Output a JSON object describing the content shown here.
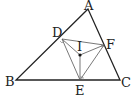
{
  "diagram": {
    "type": "geometry",
    "labels": {
      "A": "A",
      "B": "B",
      "C": "C",
      "D": "D",
      "E": "E",
      "F": "F",
      "I": "I"
    },
    "points": {
      "A": [
        88,
        9
      ],
      "B": [
        16,
        80
      ],
      "C": [
        120,
        80
      ],
      "D": [
        62,
        39
      ],
      "E": [
        80,
        80
      ],
      "F": [
        104,
        45
      ],
      "I": [
        80,
        55
      ]
    },
    "segments": [
      [
        "A",
        "B"
      ],
      [
        "B",
        "C"
      ],
      [
        "C",
        "A"
      ],
      [
        "D",
        "E"
      ],
      [
        "E",
        "F"
      ],
      [
        "F",
        "D"
      ],
      [
        "I",
        "D"
      ],
      [
        "I",
        "E"
      ],
      [
        "I",
        "F"
      ]
    ]
  }
}
